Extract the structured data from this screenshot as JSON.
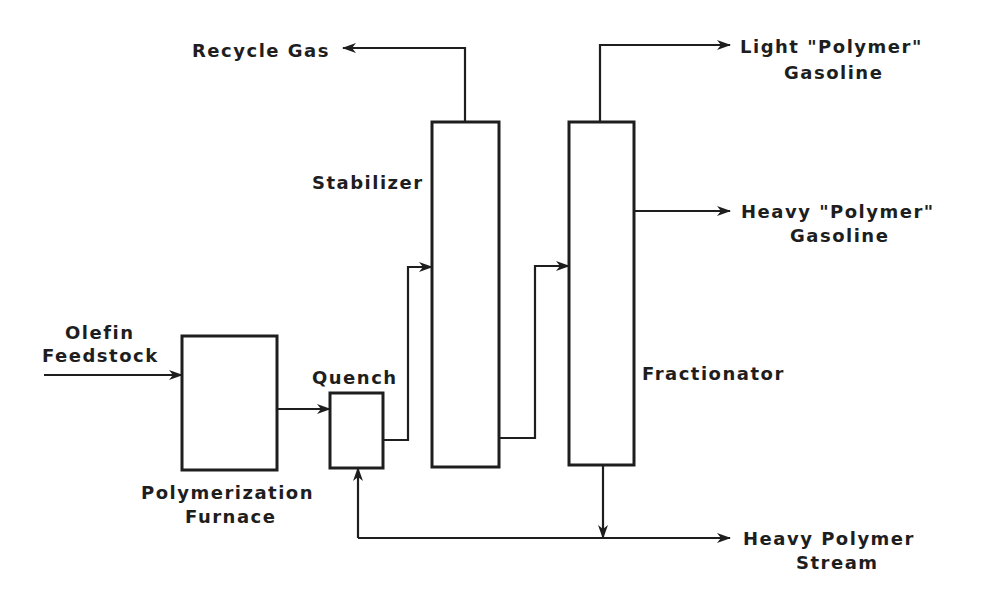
{
  "diagram": {
    "type": "process-flow",
    "units": {
      "furnace": {
        "label_line1": "Polymerization",
        "label_line2": "Furnace"
      },
      "quench": {
        "label": "Quench"
      },
      "stabilizer": {
        "label": "Stabilizer"
      },
      "fractionator": {
        "label": "Fractionator"
      }
    },
    "streams": {
      "feed": {
        "label_line1": "Olefin",
        "label_line2": "Feedstock"
      },
      "recycle_gas": {
        "label": "Recycle Gas"
      },
      "light_gasoline": {
        "label_line1": "Light \"Polymer\"",
        "label_line2": "Gasoline"
      },
      "heavy_gasoline": {
        "label_line1": "Heavy \"Polymer\"",
        "label_line2": "Gasoline"
      },
      "heavy_polymer": {
        "label_line1": "Heavy Polymer",
        "label_line2": "Stream"
      }
    },
    "connections": [
      {
        "from": "Olefin Feedstock",
        "to": "Polymerization Furnace"
      },
      {
        "from": "Polymerization Furnace",
        "to": "Quench"
      },
      {
        "from": "Quench",
        "to": "Stabilizer"
      },
      {
        "from": "Stabilizer",
        "to": "Recycle Gas"
      },
      {
        "from": "Stabilizer",
        "to": "Fractionator"
      },
      {
        "from": "Fractionator",
        "to": "Light \"Polymer\" Gasoline"
      },
      {
        "from": "Fractionator",
        "to": "Heavy \"Polymer\" Gasoline"
      },
      {
        "from": "Fractionator",
        "to": "Heavy Polymer Stream"
      },
      {
        "from": "Heavy Polymer Stream",
        "to": "Quench"
      }
    ]
  }
}
